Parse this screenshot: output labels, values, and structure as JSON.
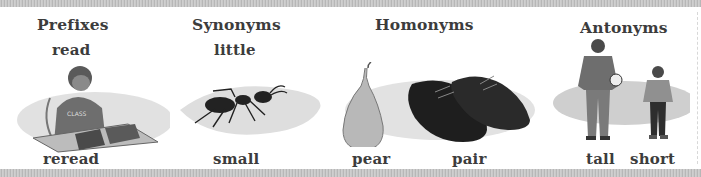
{
  "panels": [
    {
      "category": "Prefixes",
      "top_word": "read",
      "bottom_words": [
        "reread"
      ],
      "illustration": "boy-reading-book"
    },
    {
      "category": "Synonyms",
      "top_word": "little",
      "bottom_words": [
        "small"
      ],
      "illustration": "ant"
    },
    {
      "category": "Homonyms",
      "top_word": "",
      "bottom_words": [
        "pear",
        "pair"
      ],
      "illustration": "pear-and-pair-of-shoes"
    },
    {
      "category": "Antonyms",
      "top_word": "",
      "bottom_words": [
        "tall",
        "short"
      ],
      "illustration": "tall-and-short-boys"
    }
  ]
}
